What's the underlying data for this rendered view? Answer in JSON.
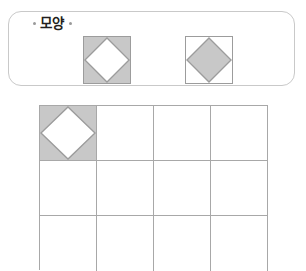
{
  "worksheet": {
    "name": "shape-pattern-worksheet",
    "panel": {
      "title": "모양",
      "border_color": "#c9c9c9",
      "shapes": [
        {
          "id": "shape-1",
          "description": "gray-square-white-diamond",
          "square_fill": "#c8c8c8",
          "diamond_fill": "#ffffff",
          "outline_color": "#9c9c9c"
        },
        {
          "id": "shape-2",
          "description": "white-square-gray-diamond",
          "square_fill": "#ffffff",
          "diamond_fill": "#c8c8c8",
          "outline_color": "#9c9c9c"
        }
      ]
    },
    "grid": {
      "columns": 4,
      "rows": 3,
      "line_color": "#a8a8a8",
      "cells": [
        {
          "row": 1,
          "col": 1,
          "filled": true,
          "pattern": "gray-square-white-diamond"
        },
        {
          "row": 1,
          "col": 2,
          "filled": false,
          "pattern": ""
        },
        {
          "row": 1,
          "col": 3,
          "filled": false,
          "pattern": ""
        },
        {
          "row": 1,
          "col": 4,
          "filled": false,
          "pattern": ""
        },
        {
          "row": 2,
          "col": 1,
          "filled": false,
          "pattern": ""
        },
        {
          "row": 2,
          "col": 2,
          "filled": false,
          "pattern": ""
        },
        {
          "row": 2,
          "col": 3,
          "filled": false,
          "pattern": ""
        },
        {
          "row": 2,
          "col": 4,
          "filled": false,
          "pattern": ""
        },
        {
          "row": 3,
          "col": 1,
          "filled": false,
          "pattern": ""
        },
        {
          "row": 3,
          "col": 2,
          "filled": false,
          "pattern": ""
        },
        {
          "row": 3,
          "col": 3,
          "filled": false,
          "pattern": ""
        },
        {
          "row": 3,
          "col": 4,
          "filled": false,
          "pattern": ""
        }
      ]
    }
  }
}
